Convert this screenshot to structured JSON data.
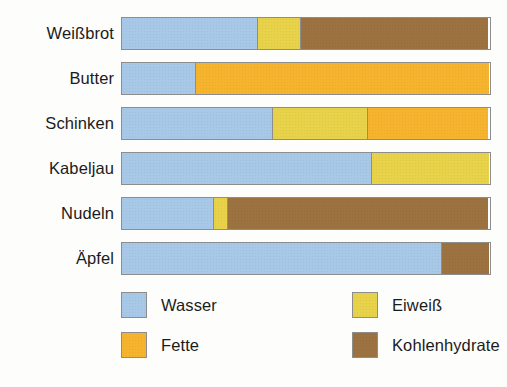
{
  "chart_data": {
    "type": "bar",
    "subtype": "stacked-horizontal-100pct",
    "title": "",
    "subtitle": "",
    "xlabel": "",
    "ylabel": "",
    "xlim": [
      0,
      100
    ],
    "grid": false,
    "legend_position": "bottom",
    "categories": [
      "Weißbrot",
      "Butter",
      "Schinken",
      "Kabeljau",
      "Nudeln",
      "Äpfel"
    ],
    "series": [
      {
        "name": "Wasser",
        "color": "#a8c8e8",
        "values": [
          37,
          20,
          41,
          68,
          25,
          87
        ]
      },
      {
        "name": "Fette",
        "color": "#f6b42e",
        "values": [
          0,
          80,
          33,
          0,
          0,
          0
        ]
      },
      {
        "name": "Eiweiß",
        "color": "#e8d24a",
        "values": [
          12,
          0,
          26,
          32,
          4,
          0
        ]
      },
      {
        "name": "Kohlenhydrate",
        "color": "#9c7340",
        "values": [
          51,
          0,
          0,
          0,
          71,
          13
        ]
      }
    ],
    "bars": [
      {
        "category": "Weißbrot",
        "segments": [
          {
            "series": "Wasser",
            "value": 37,
            "color": "#a8c8e8"
          },
          {
            "series": "Eiweiß",
            "value": 12,
            "color": "#e8d24a"
          },
          {
            "series": "Kohlenhydrate",
            "value": 51,
            "color": "#9c7340"
          }
        ]
      },
      {
        "category": "Butter",
        "segments": [
          {
            "series": "Wasser",
            "value": 20,
            "color": "#a8c8e8"
          },
          {
            "series": "Fette",
            "value": 80,
            "color": "#f6b42e"
          }
        ]
      },
      {
        "category": "Schinken",
        "segments": [
          {
            "series": "Wasser",
            "value": 41,
            "color": "#a8c8e8"
          },
          {
            "series": "Eiweiß",
            "value": 26,
            "color": "#e8d24a"
          },
          {
            "series": "Fette",
            "value": 33,
            "color": "#f6b42e"
          }
        ]
      },
      {
        "category": "Kabeljau",
        "segments": [
          {
            "series": "Wasser",
            "value": 68,
            "color": "#a8c8e8"
          },
          {
            "series": "Eiweiß",
            "value": 32,
            "color": "#e8d24a"
          }
        ]
      },
      {
        "category": "Nudeln",
        "segments": [
          {
            "series": "Wasser",
            "value": 25,
            "color": "#a8c8e8"
          },
          {
            "series": "Eiweiß",
            "value": 4,
            "color": "#e8d24a"
          },
          {
            "series": "Kohlenhydrate",
            "value": 71,
            "color": "#9c7340"
          }
        ]
      },
      {
        "category": "Äpfel",
        "segments": [
          {
            "series": "Wasser",
            "value": 87,
            "color": "#a8c8e8"
          },
          {
            "series": "Kohlenhydrate",
            "value": 13,
            "color": "#9c7340"
          }
        ]
      }
    ],
    "legend": [
      {
        "label": "Wasser",
        "color": "#a8c8e8"
      },
      {
        "label": "Eiweiß",
        "color": "#e8d24a"
      },
      {
        "label": "Fette",
        "color": "#f6b42e"
      },
      {
        "label": "Kohlenhydrate",
        "color": "#9c7340"
      }
    ]
  },
  "labels": {
    "cat0": "Weißbrot",
    "cat1": "Butter",
    "cat2": "Schinken",
    "cat3": "Kabeljau",
    "cat4": "Nudeln",
    "cat5": "Äpfel"
  },
  "legend_labels": {
    "wasser": "Wasser",
    "eiweiss": "Eiweiß",
    "fette": "Fette",
    "kohlenhydrate": "Kohlenhydrate"
  }
}
